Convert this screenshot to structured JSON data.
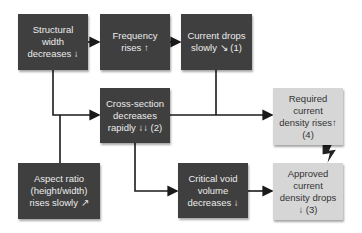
{
  "diagram": {
    "colors": {
      "dark_box": "#3f3f3f",
      "light_box": "#d6d6d6",
      "line": "#1a1a1a"
    },
    "nodes": [
      {
        "id": "structural-width",
        "text": "Structural\nwidth\ndecreases ↓",
        "style": "dark"
      },
      {
        "id": "frequency",
        "text": "Frequency\nrises ↑",
        "style": "dark"
      },
      {
        "id": "current-drops",
        "text": "Current drops\nslowly ↘ (1)",
        "style": "dark"
      },
      {
        "id": "cross-section",
        "text": "Cross-section\ndecreases\nrapidly ↓↓ (2)",
        "style": "dark"
      },
      {
        "id": "required-density",
        "text": "Required\ncurrent\ndensity rises↑\n(4)",
        "style": "light"
      },
      {
        "id": "aspect-ratio",
        "text": "Aspect ratio\n(height/width)\nrises slowly ↗",
        "style": "dark"
      },
      {
        "id": "critical-void",
        "text": "Critical void\nvolume\ndecreases ↓",
        "style": "dark"
      },
      {
        "id": "approved-density",
        "text": "Approved\ncurrent\ndensity drops\n↓ (3)",
        "style": "light"
      }
    ],
    "edges": [
      {
        "from": "structural-width",
        "to": "frequency"
      },
      {
        "from": "frequency",
        "to": "current-drops"
      },
      {
        "from": "structural-width",
        "to": "cross-section"
      },
      {
        "from": "aspect-ratio",
        "to": "cross-section"
      },
      {
        "from": "cross-section",
        "to": "required-density"
      },
      {
        "from": "current-drops",
        "to": "required-density"
      },
      {
        "from": "cross-section",
        "to": "critical-void"
      },
      {
        "from": "critical-void",
        "to": "approved-density"
      }
    ],
    "conflict": {
      "between": [
        "required-density",
        "approved-density"
      ],
      "icon": "lightning-bolt"
    }
  }
}
